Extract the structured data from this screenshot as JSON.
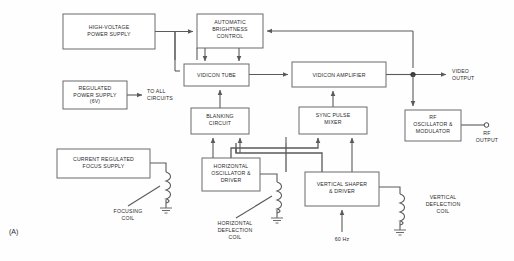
{
  "figure": {
    "panel_label": "(A)",
    "type": "block-diagram"
  },
  "blocks": [
    {
      "id": "hv-power-supply",
      "lines": [
        "HIGH-VOLTAGE",
        "POWER SUPPLY"
      ],
      "x": 63,
      "y": 14,
      "w": 92,
      "h": 35
    },
    {
      "id": "regulated-power-supply",
      "lines": [
        "REGULATED",
        "POWER SUPPLY",
        "(6V)"
      ],
      "x": 63,
      "y": 81,
      "w": 64,
      "h": 28
    },
    {
      "id": "automatic-brightness-control",
      "lines": [
        "AUTOMATIC",
        "BRIGHTNESS",
        "CONTROL"
      ],
      "x": 197,
      "y": 14,
      "w": 66,
      "h": 34
    },
    {
      "id": "vidicon-tube",
      "lines": [
        "VIDICON TUBE"
      ],
      "x": 184,
      "y": 64,
      "w": 65,
      "h": 22
    },
    {
      "id": "vidicon-amplifier",
      "lines": [
        "VIDICON AMPLIFIER"
      ],
      "x": 292,
      "y": 62,
      "w": 94,
      "h": 25
    },
    {
      "id": "blanking-circuit",
      "lines": [
        "BLANKING",
        "CIRCUIT"
      ],
      "x": 191,
      "y": 108,
      "w": 58,
      "h": 26
    },
    {
      "id": "sync-pulse-mixer",
      "lines": [
        "SYNC PULSE",
        "MIXER"
      ],
      "x": 299,
      "y": 107,
      "w": 68,
      "h": 27
    },
    {
      "id": "rf-oscillator-modulator",
      "lines": [
        "RF",
        "OSCILLATOR &",
        "MODULATOR"
      ],
      "x": 405,
      "y": 110,
      "w": 56,
      "h": 31
    },
    {
      "id": "horizontal-oscillator-driver",
      "lines": [
        "HORIZONTAL",
        "OSCILLATOR &",
        "DRIVER"
      ],
      "x": 202,
      "y": 158,
      "w": 58,
      "h": 33
    },
    {
      "id": "vertical-shaper-driver",
      "lines": [
        "VERTICAL SHAPER",
        "& DRIVER"
      ],
      "x": 305,
      "y": 172,
      "w": 74,
      "h": 34
    }
  ],
  "annotations": [
    {
      "id": "to-all-circuits",
      "lines": [
        "TO ALL",
        "CIRCUITS"
      ],
      "x": 147,
      "y": 90
    },
    {
      "id": "video-output",
      "lines": [
        "VIDEO",
        "OUTPUT"
      ],
      "x": 461,
      "y": 74
    },
    {
      "id": "rf-output",
      "lines": [
        "RF",
        "OUTPUT"
      ],
      "x": 491,
      "y": 128
    },
    {
      "id": "focusing-coil",
      "lines": [
        "FOCUSING",
        "COIL"
      ],
      "x": 128,
      "y": 212
    },
    {
      "id": "horizontal-deflection-coil",
      "lines": [
        "HORIZONTAL",
        "DEFLECTION",
        "COIL"
      ],
      "x": 235,
      "y": 224
    },
    {
      "id": "vertical-deflection-coil",
      "lines": [
        "VERTICAL",
        "DEFLECTION",
        "COIL"
      ],
      "x": 452,
      "y": 207
    },
    {
      "id": "focus-supply-box-caption",
      "lines": [
        "CURRENT REGULATED",
        "FOCUS SUPPLY"
      ],
      "x": 0,
      "y": 0
    },
    {
      "id": "line-frequency",
      "lines": [
        "60 Hz"
      ],
      "x": 342,
      "y": 240
    }
  ],
  "focus_supply": {
    "id": "current-regulated-focus-supply",
    "lines": [
      "CURRENT REGULATED",
      "FOCUS SUPPLY"
    ],
    "x": 57,
    "y": 149,
    "w": 93,
    "h": 29
  },
  "colors": {
    "background": "#fefefe",
    "box_stroke": "#6b6b6b",
    "wire": "#5a5a5a",
    "text": "#2a2a2a"
  }
}
